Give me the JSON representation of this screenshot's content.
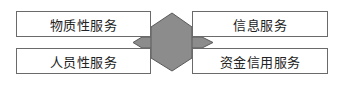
{
  "diagram": {
    "boxes": [
      {
        "id": "b1",
        "label": "物质性服务"
      },
      {
        "id": "b2",
        "label": "人员性服务"
      },
      {
        "id": "b3",
        "label": "信息服务"
      },
      {
        "id": "b4",
        "label": "资金信用服务"
      }
    ],
    "hub_color": "#8c8c8c",
    "hub_stroke": "#5a5a5a"
  }
}
